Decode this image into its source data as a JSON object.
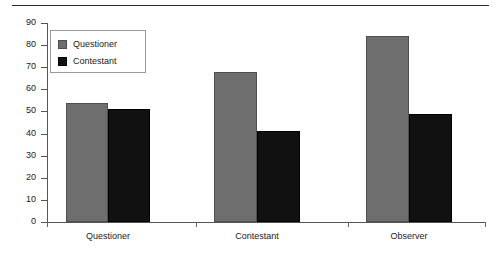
{
  "chart_data": {
    "type": "bar",
    "title": "",
    "subtitle": "",
    "xlabel": "",
    "ylabel": "",
    "categories": [
      "Questioner",
      "Contestant",
      "Observer"
    ],
    "series": [
      {
        "name": "Questioner",
        "color": "#6e6e6e",
        "values": [
          54,
          68,
          84
        ]
      },
      {
        "name": "Contestant",
        "color": "#111111",
        "values": [
          51,
          41,
          49
        ]
      }
    ],
    "ylim": [
      0,
      90
    ],
    "ytick_labels": [
      "0",
      "10",
      "20",
      "30",
      "40",
      "50",
      "60",
      "70",
      "80",
      "90"
    ],
    "ytick_values": [
      0,
      10,
      20,
      30,
      40,
      50,
      60,
      70,
      80,
      90
    ],
    "grid": false,
    "legend_position": "upper-left",
    "legend_entries": [
      "Questioner",
      "Contestant"
    ]
  },
  "legend": {
    "items": [
      {
        "label": "Questioner"
      },
      {
        "label": "Contestant"
      }
    ]
  }
}
